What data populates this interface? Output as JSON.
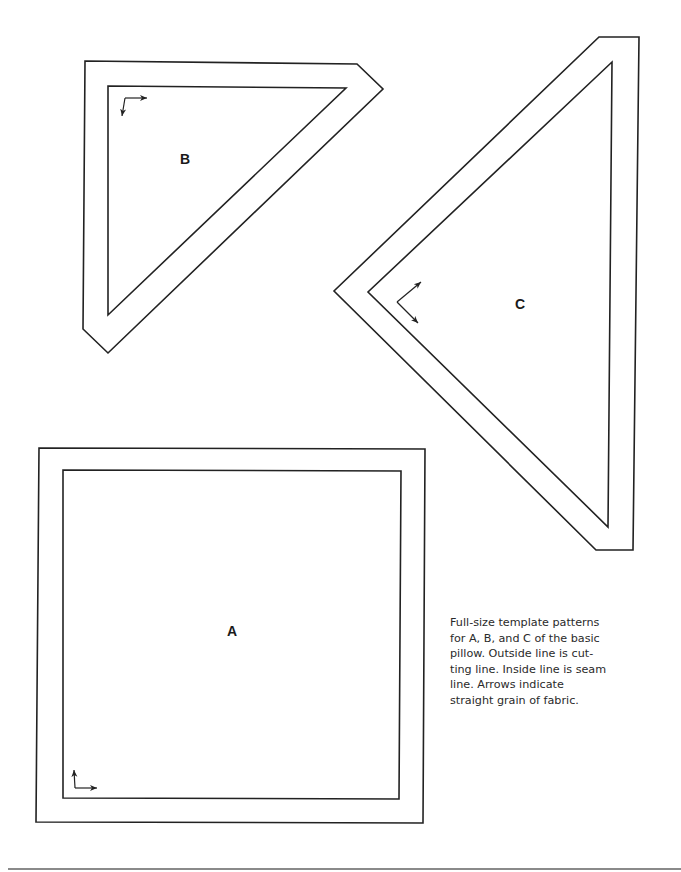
{
  "patterns": {
    "a": {
      "label": "A"
    },
    "b": {
      "label": "B"
    },
    "c": {
      "label": "C"
    }
  },
  "caption": {
    "lines": [
      "Full-size template patterns",
      "for A, B, and C of the basic",
      "pillow. Outside line is cut-",
      "ting line. Inside line is seam",
      "line. Arrows indicate",
      "straight grain of fabric."
    ]
  },
  "legend_semantics": {
    "outside_line": "cutting line",
    "inside_line": "seam line",
    "arrows": "straight grain of fabric"
  },
  "colors": {
    "line": "#222222",
    "text": "#2a2a2a",
    "rule": "#8a8a8a",
    "background": "#ffffff"
  }
}
